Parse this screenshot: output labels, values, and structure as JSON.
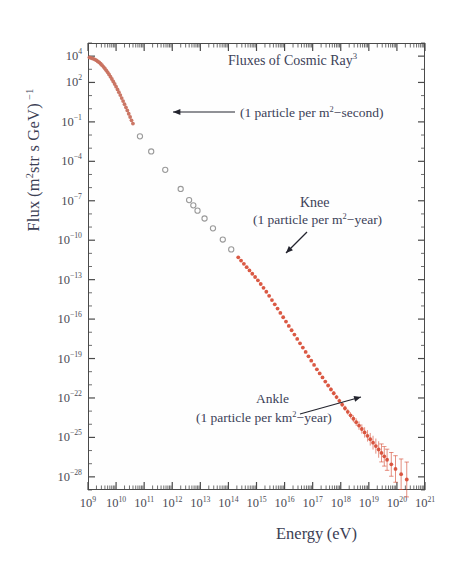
{
  "chart_data": {
    "type": "scatter",
    "xlabel": "Energy (eV)",
    "ylabel": "Flux (m²str s GeV) ⁻¹",
    "xlim": [
      9,
      21
    ],
    "ylim": [
      -29,
      5
    ],
    "xscale": "log",
    "yscale": "log",
    "grid": false,
    "legend": "none",
    "xtick_labels": [
      "10⁹",
      "10¹⁰",
      "10¹¹",
      "10¹²",
      "10¹³",
      "10¹⁴",
      "10¹⁵",
      "10¹⁶",
      "10¹⁷",
      "10¹⁸",
      "10¹⁹",
      "10²⁰",
      "10²¹"
    ],
    "xtick_exponents": [
      9,
      10,
      11,
      12,
      13,
      14,
      15,
      16,
      17,
      18,
      19,
      20,
      21
    ],
    "ytick_labels": [
      "10⁴",
      "10²",
      "10⁻¹",
      "10⁻⁴",
      "10⁻⁷",
      "10⁻¹⁰",
      "10⁻¹³",
      "10⁻¹⁶",
      "10⁻¹⁹",
      "10⁻²²",
      "10⁻²⁵",
      "10⁻²⁸"
    ],
    "ytick_exponents": [
      4,
      2,
      -1,
      -4,
      -7,
      -10,
      -13,
      -16,
      -19,
      -22,
      -25,
      -28
    ],
    "series": [
      {
        "name": "direct-measurements-dense",
        "marker": "filled-circle",
        "color": "#c8705e",
        "points": [
          [
            9.05,
            3.9
          ],
          [
            9.1,
            3.87
          ],
          [
            9.15,
            3.83
          ],
          [
            9.2,
            3.8
          ],
          [
            9.25,
            3.74
          ],
          [
            9.3,
            3.68
          ],
          [
            9.35,
            3.6
          ],
          [
            9.4,
            3.52
          ],
          [
            9.45,
            3.42
          ],
          [
            9.5,
            3.31
          ],
          [
            9.55,
            3.19
          ],
          [
            9.6,
            3.06
          ],
          [
            9.65,
            2.92
          ],
          [
            9.7,
            2.77
          ],
          [
            9.75,
            2.61
          ],
          [
            9.8,
            2.44
          ],
          [
            9.85,
            2.26
          ],
          [
            9.9,
            2.07
          ],
          [
            9.95,
            1.88
          ],
          [
            10.0,
            1.68
          ],
          [
            10.05,
            1.47
          ],
          [
            10.1,
            1.26
          ],
          [
            10.15,
            1.04
          ],
          [
            10.2,
            0.81
          ],
          [
            10.25,
            0.58
          ],
          [
            10.3,
            0.35
          ],
          [
            10.35,
            0.11
          ],
          [
            10.4,
            -0.13
          ],
          [
            10.45,
            -0.38
          ],
          [
            10.5,
            -0.63
          ],
          [
            10.55,
            -0.88
          ],
          [
            10.6,
            -1.13
          ]
        ]
      },
      {
        "name": "indirect-measurements-sparse",
        "marker": "open-circle",
        "color": "#9a9a9a",
        "points": [
          [
            10.85,
            -2.1
          ],
          [
            11.25,
            -3.25
          ],
          [
            11.75,
            -4.65
          ],
          [
            12.3,
            -6.1
          ],
          [
            12.6,
            -6.95
          ],
          [
            12.75,
            -7.35
          ],
          [
            12.9,
            -7.75
          ],
          [
            13.15,
            -8.35
          ],
          [
            13.45,
            -9.1
          ],
          [
            13.8,
            -9.95
          ],
          [
            14.1,
            -10.7
          ]
        ]
      },
      {
        "name": "air-shower-array",
        "marker": "filled-circle",
        "color": "#d8503a",
        "points": [
          [
            14.35,
            -11.3
          ],
          [
            14.45,
            -11.55
          ],
          [
            14.55,
            -11.8
          ],
          [
            14.65,
            -12.05
          ],
          [
            14.75,
            -12.3
          ],
          [
            14.85,
            -12.55
          ],
          [
            14.95,
            -12.8
          ],
          [
            15.05,
            -13.05
          ],
          [
            15.15,
            -13.33
          ],
          [
            15.25,
            -13.62
          ],
          [
            15.35,
            -13.92
          ],
          [
            15.45,
            -14.23
          ],
          [
            15.55,
            -14.55
          ],
          [
            15.65,
            -14.88
          ],
          [
            15.75,
            -15.2
          ],
          [
            15.85,
            -15.53
          ],
          [
            15.95,
            -15.86
          ],
          [
            16.05,
            -16.19
          ],
          [
            16.15,
            -16.52
          ],
          [
            16.25,
            -16.85
          ],
          [
            16.35,
            -17.18
          ],
          [
            16.45,
            -17.51
          ],
          [
            16.55,
            -17.84
          ],
          [
            16.65,
            -18.17
          ],
          [
            16.75,
            -18.5
          ],
          [
            16.85,
            -18.83
          ],
          [
            16.95,
            -19.16
          ],
          [
            17.05,
            -19.49
          ],
          [
            17.15,
            -19.82
          ],
          [
            17.25,
            -20.13
          ],
          [
            17.35,
            -20.44
          ],
          [
            17.45,
            -20.75
          ],
          [
            17.55,
            -21.05
          ],
          [
            17.65,
            -21.35
          ],
          [
            17.75,
            -21.64
          ],
          [
            17.85,
            -21.93
          ],
          [
            17.95,
            -22.22
          ],
          [
            18.05,
            -22.5
          ],
          [
            18.15,
            -22.78
          ],
          [
            18.25,
            -23.05
          ],
          [
            18.35,
            -23.32
          ],
          [
            18.45,
            -23.58
          ],
          [
            18.55,
            -23.84
          ],
          [
            18.65,
            -24.1
          ],
          [
            18.75,
            -24.36
          ],
          [
            18.85,
            -24.62
          ],
          [
            18.95,
            -24.88
          ],
          [
            19.05,
            -25.14
          ],
          [
            19.15,
            -25.4
          ],
          [
            19.25,
            -25.66
          ],
          [
            19.35,
            -25.92
          ],
          [
            19.45,
            -26.18
          ],
          [
            19.55,
            -26.44
          ],
          [
            19.65,
            -26.7
          ],
          [
            19.8,
            -27.05
          ],
          [
            19.95,
            -27.4
          ],
          [
            20.15,
            -27.8
          ],
          [
            20.35,
            -28.2
          ]
        ]
      }
    ],
    "annotations": [
      {
        "name": "flux-1-per-m2-second",
        "text": "(1 particle per m²−second)",
        "arrow": "left",
        "points_to_x": 11.0,
        "points_to_y": -1.0
      },
      {
        "name": "knee-label",
        "text": "Knee",
        "caption": "(1 particle per m²−year)",
        "arrow": "down-left",
        "points_to_x": 15.5,
        "points_to_y": -14.8
      },
      {
        "name": "ankle-label",
        "text": "Ankle",
        "caption": "(1 particle per km²−year)",
        "arrow": "up-right",
        "points_to_x": 18.6,
        "points_to_y": -24.0
      }
    ]
  },
  "axes": {
    "y_title": "Flux (m²str s GeV) ⁻¹",
    "x_title": "Energy (eV)"
  },
  "colors": {
    "data_primary": "#d8503a",
    "data_secondary": "#c8705e",
    "data_open": "#9a9a9a",
    "text": "#3c4158",
    "frame": "#4a4a4a",
    "background": "#ffffff"
  }
}
